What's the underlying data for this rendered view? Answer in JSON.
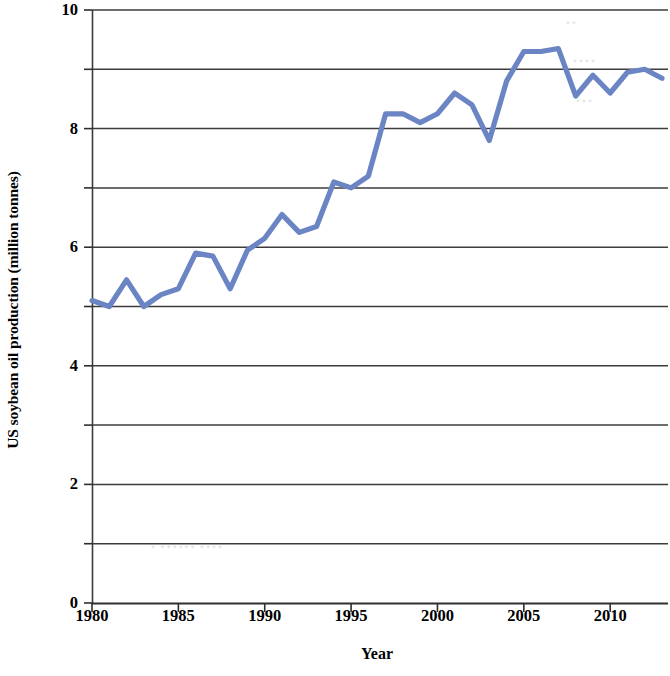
{
  "chart_data": {
    "type": "line",
    "title": "",
    "xlabel": "Year",
    "ylabel": "US soybean oil production (million tonnes)",
    "xlim": [
      1980,
      2013
    ],
    "ylim": [
      0,
      10
    ],
    "xticks": [
      "1980",
      "1985",
      "1990",
      "1995",
      "2000",
      "2005",
      "2010"
    ],
    "xtick_values": [
      1980,
      1985,
      1990,
      1995,
      2000,
      2005,
      2010
    ],
    "yticks": [
      "0",
      "2",
      "4",
      "6",
      "8",
      "10"
    ],
    "ytick_values": [
      0,
      2,
      4,
      6,
      8,
      10
    ],
    "gridlines_y": [
      1,
      2,
      3,
      4,
      5,
      6,
      7,
      8,
      9,
      10
    ],
    "grid": "horizontal",
    "legend": "none",
    "series": [
      {
        "name": "US soybean oil production",
        "color": "#6b85c4",
        "x": [
          1980,
          1981,
          1982,
          1983,
          1984,
          1985,
          1986,
          1987,
          1988,
          1989,
          1990,
          1991,
          1992,
          1993,
          1994,
          1995,
          1996,
          1997,
          1998,
          1999,
          2000,
          2001,
          2002,
          2003,
          2004,
          2005,
          2006,
          2007,
          2008,
          2009,
          2010,
          2011,
          2012,
          2013
        ],
        "values": [
          5.1,
          5.0,
          5.45,
          5.0,
          5.2,
          5.3,
          5.9,
          5.85,
          5.3,
          5.95,
          6.15,
          6.55,
          6.25,
          6.35,
          7.1,
          7.0,
          7.2,
          8.25,
          8.25,
          8.1,
          8.25,
          8.6,
          8.4,
          7.8,
          8.8,
          9.3,
          9.3,
          9.35,
          8.55,
          8.9,
          8.6,
          8.95,
          9.0,
          8.85
        ]
      }
    ]
  },
  "axes": {
    "ylabel": "US soybean oil production (million tonnes)",
    "xlabel": "Year"
  }
}
